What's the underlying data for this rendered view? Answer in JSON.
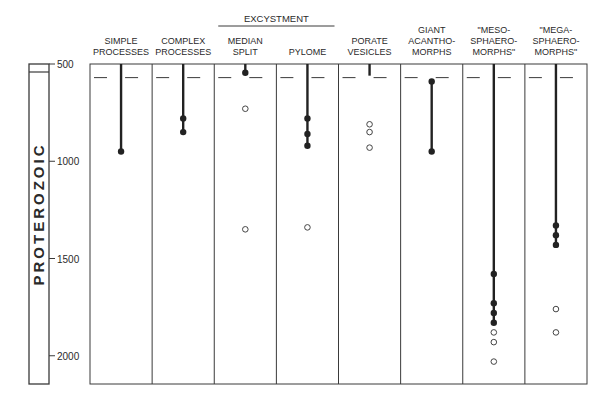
{
  "chart_data": {
    "type": "scatter",
    "title": "",
    "ylabel": "PROTEROZOIC",
    "xlabel": "",
    "yaxis": {
      "ticks": [
        500,
        1000,
        1500,
        2000
      ],
      "tick_labels": [
        "500",
        "1000",
        "1500",
        "2000"
      ],
      "range": [
        500,
        2100
      ],
      "inverted": true
    },
    "group_header": {
      "label": "EXCYSTMENT",
      "spans": [
        "MEDIAN SPLIT",
        "PYLOME"
      ]
    },
    "reference_line_age": 570,
    "categories": [
      {
        "label_lines": [
          "SIMPLE",
          "PROCESSES"
        ],
        "range_line": [
          500,
          950
        ],
        "solid": [
          950
        ],
        "open": []
      },
      {
        "label_lines": [
          "COMPLEX",
          "PROCESSES"
        ],
        "range_line": [
          500,
          850
        ],
        "solid": [
          780,
          850
        ],
        "open": []
      },
      {
        "label_lines": [
          "MEDIAN",
          "SPLIT"
        ],
        "range_line": [
          500,
          545
        ],
        "solid": [
          545
        ],
        "open": [
          730,
          1350
        ]
      },
      {
        "label_lines": [
          "PYLOME"
        ],
        "range_line": [
          500,
          920
        ],
        "solid": [
          780,
          860,
          920
        ],
        "open": [
          1340
        ]
      },
      {
        "label_lines": [
          "PORATE",
          "VESICLES"
        ],
        "range_line": [
          500,
          560
        ],
        "solid": [],
        "open": [
          810,
          850,
          930
        ]
      },
      {
        "label_lines": [
          "GIANT",
          "ACANTHO-",
          "MORPHS"
        ],
        "range_line": [
          590,
          950
        ],
        "solid": [
          590,
          950
        ],
        "open": []
      },
      {
        "label_lines": [
          "\"MESO-",
          "SPHAERO-",
          "MORPHS\""
        ],
        "range_line": [
          500,
          1830
        ],
        "solid": [
          1580,
          1730,
          1780,
          1830
        ],
        "open": [
          1880,
          1930,
          2030
        ]
      },
      {
        "label_lines": [
          "\"MEGA-",
          "SPHAERO-",
          "MORPHS\""
        ],
        "range_line": [
          500,
          1430
        ],
        "solid": [
          1330,
          1380,
          1430
        ],
        "open": [
          1760,
          1880
        ]
      }
    ],
    "legend": {
      "solid": "filled circle",
      "open": "open circle"
    },
    "grid": false
  }
}
